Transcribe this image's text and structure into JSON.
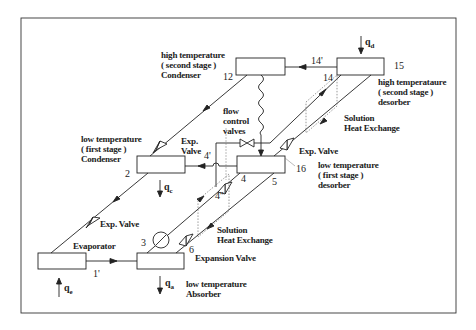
{
  "diagram": {
    "components": [
      {
        "id": "ht_condenser",
        "label_lines": [
          "high temperature",
          "( second stage )",
          "Condenser"
        ],
        "state_point": "12"
      },
      {
        "id": "ht_desorber",
        "label_lines": [
          "high temperataure",
          "( second stage )",
          "desorber"
        ],
        "state_point": "15"
      },
      {
        "id": "lt_condenser",
        "label_lines": [
          "low temperature",
          "( first stage )",
          "Condenser"
        ],
        "state_point": "2"
      },
      {
        "id": "lt_desorber",
        "label_lines": [
          "low temperature",
          "( first stage )",
          "desorber"
        ],
        "state_point": "16"
      },
      {
        "id": "evaporator",
        "label_lines": [
          "Evaporator"
        ]
      },
      {
        "id": "absorber",
        "label_lines": [
          "low temperature",
          "Absorber"
        ]
      }
    ],
    "valves": {
      "exp_valve_upper_left": [
        "Exp.",
        "Valve"
      ],
      "exp_valve_right": "Exp. Valve",
      "exp_valve_lower_left": "Exp. Valve",
      "expansion_valve": "Expansion Valve",
      "flow_control": [
        "flow",
        "control",
        "valves"
      ]
    },
    "heat_exchangers": {
      "upper": [
        "Solution",
        "Heat Exchange"
      ],
      "lower": [
        "Solution",
        "Heat Exchange"
      ]
    },
    "state_points": {
      "p1p": "1'",
      "p2": "2",
      "p3": "3",
      "p4": "4",
      "p4p": "4'",
      "p4pp": "4''",
      "p5": "5",
      "p6": "6",
      "p12": "12",
      "p14": "14",
      "p14p": "14'",
      "p15": "15",
      "p16": "16"
    },
    "heat_flows": {
      "qd": {
        "sym": "q",
        "sub": "d"
      },
      "qc": {
        "sym": "q",
        "sub": "c"
      },
      "qe": {
        "sym": "q",
        "sub": "e"
      },
      "qa": {
        "sym": "q",
        "sub": "a"
      }
    }
  }
}
